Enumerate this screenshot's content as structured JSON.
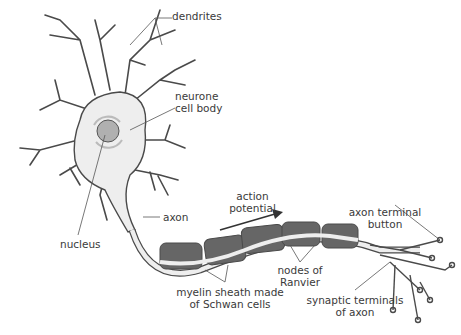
{
  "diagram": {
    "type": "labelled biological diagram",
    "subject": "neurone",
    "labels": {
      "dendrites": "dendrites",
      "cell_body_1": "neurone",
      "cell_body_2": "cell body",
      "nucleus": "nucleus",
      "axon": "axon",
      "action_potential_1": "action",
      "action_potential_2": "potential",
      "myelin_1": "myelin sheath made",
      "myelin_2": "of Schwan cells",
      "nodes_1": "nodes of",
      "nodes_2": "Ranvier",
      "terminal_button_1": "axon terminal",
      "terminal_button_2": "button",
      "synaptic_1": "synaptic terminals",
      "synaptic_2": "of axon"
    },
    "colors": {
      "outline": "#4a4a4a",
      "cell_fill": "#eeeeee",
      "myelin": "#666666",
      "nucleus": "#b0b0b0",
      "text": "#3a3a3a"
    }
  }
}
